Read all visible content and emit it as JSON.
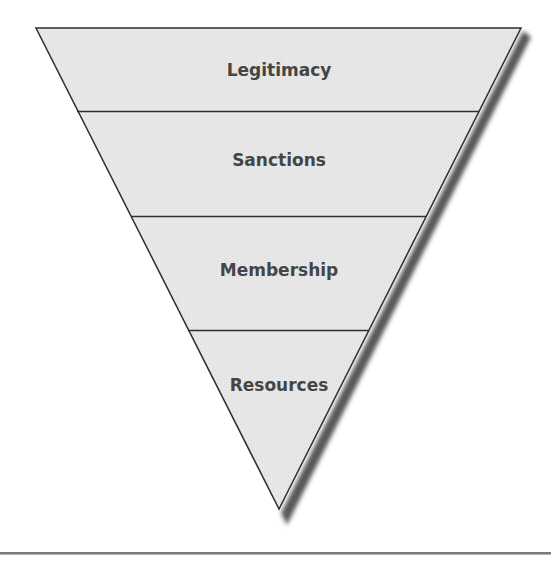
{
  "diagram": {
    "type": "inverted-pyramid",
    "layers": [
      {
        "label": "Legitimacy",
        "order": 1
      },
      {
        "label": "Sanctions",
        "order": 2
      },
      {
        "label": "Membership",
        "order": 3
      },
      {
        "label": "Resources",
        "order": 4
      }
    ],
    "colors": {
      "fill": "#e6e6e6",
      "outline": "#2e2e2e",
      "text": "#454545",
      "shadow": "#3a3a3a",
      "bottom_rule": "#7a7a7a"
    }
  }
}
